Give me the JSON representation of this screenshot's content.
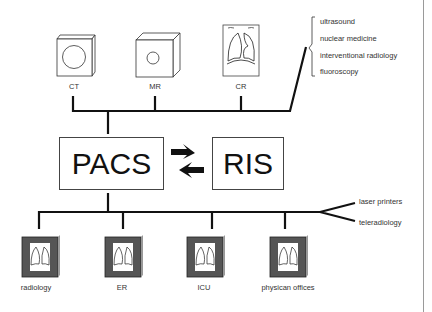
{
  "diagram": {
    "type": "network architecture",
    "modalities": [
      {
        "label": "CT",
        "icon": "ct-scanner-icon"
      },
      {
        "label": "MR",
        "icon": "mr-scanner-icon"
      },
      {
        "label": "CR",
        "icon": "cr-xray-icon"
      }
    ],
    "other_modalities": [
      "ultrasound",
      "nuclear medicine",
      "interventional radiology",
      "fluoroscopy"
    ],
    "core": {
      "pacs": "PACS",
      "ris": "RIS",
      "link": "bidirectional"
    },
    "workstations": [
      {
        "label": "radiology",
        "icon": "workstation-monitor-icon"
      },
      {
        "label": "ER",
        "icon": "workstation-monitor-icon"
      },
      {
        "label": "ICU",
        "icon": "workstation-monitor-icon"
      },
      {
        "label": "physican offices",
        "icon": "workstation-monitor-icon"
      }
    ],
    "outputs": [
      "laser printers",
      "teleradiology"
    ]
  }
}
